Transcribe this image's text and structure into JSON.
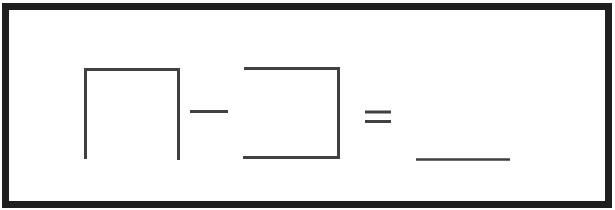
{
  "figure": {
    "kind": "subtraction-equation-worksheet",
    "elements": {
      "minuend_box": {
        "label": "minuend-box",
        "shape": "square-open-bottom"
      },
      "minus": {
        "label": "minus-sign",
        "glyph": "−"
      },
      "subtrahend_box": {
        "label": "subtrahend-box",
        "shape": "square-open-left"
      },
      "equals": {
        "label": "equals-sign",
        "glyph": "="
      },
      "answer_blank": {
        "label": "answer-blank",
        "shape": "horizontal-underline"
      }
    },
    "colors": {
      "frame": "#1f1f1f",
      "line": "#414141",
      "background": "#ffffff"
    }
  }
}
